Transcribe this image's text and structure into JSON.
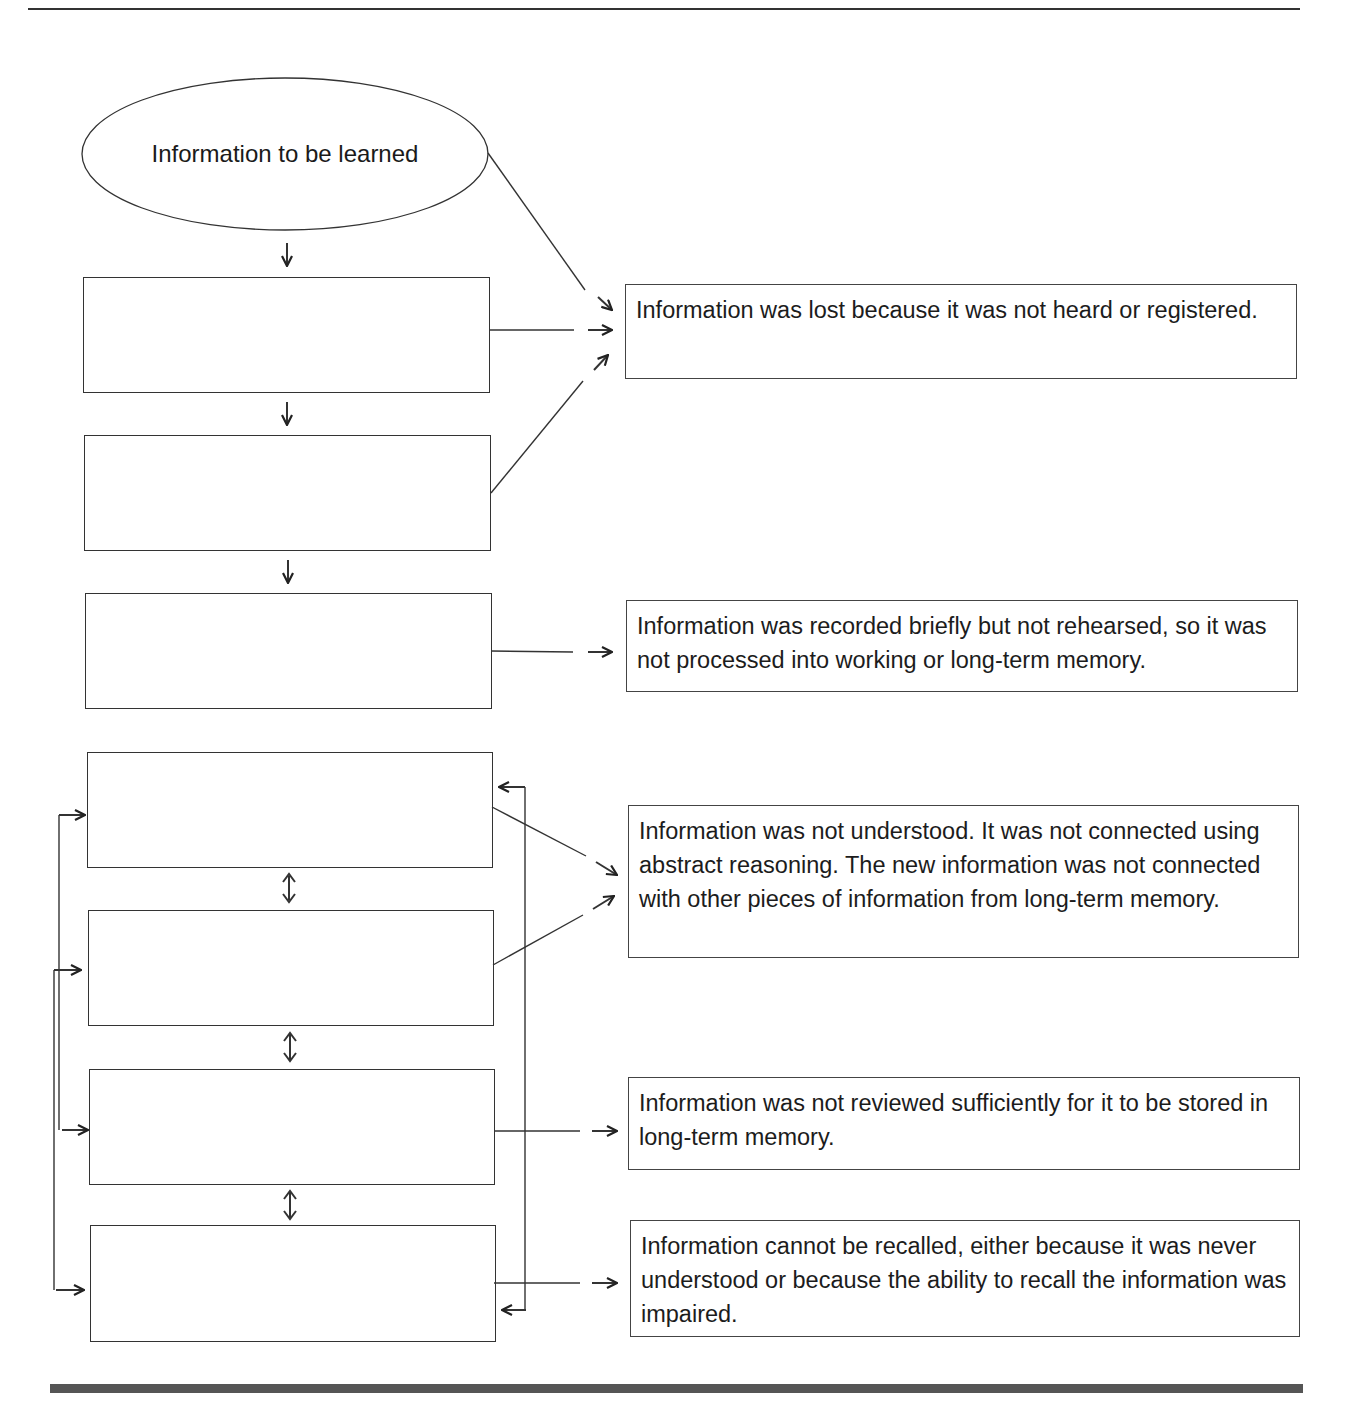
{
  "figure": {
    "header_caption": "Figure",
    "start_node": {
      "label": "Information to be learned",
      "shape": "ellipse"
    },
    "stages": [
      {
        "id": 1,
        "label": ""
      },
      {
        "id": 2,
        "label": ""
      },
      {
        "id": 3,
        "label": ""
      },
      {
        "id": 4,
        "label": ""
      },
      {
        "id": 5,
        "label": ""
      },
      {
        "id": 6,
        "label": ""
      },
      {
        "id": 7,
        "label": ""
      },
      {
        "id": 8,
        "label": ""
      }
    ],
    "outcomes": [
      {
        "id": "a",
        "text": "Information was lost because it was not heard or registered.",
        "sources": [
          "start",
          1,
          2
        ]
      },
      {
        "id": "b",
        "text": "Information was recorded briefly but not rehearsed, so it was not processed into working or long-term memory.",
        "sources": [
          3
        ]
      },
      {
        "id": "c",
        "text": "Information was not understood. It was not connected using abstract reasoning. The new information was not connected with other pieces of information from long-term memory.",
        "sources": [
          4,
          5
        ]
      },
      {
        "id": "d",
        "text": "Information was not reviewed sufficiently for it to be stored in long-term memory.",
        "sources": [
          6
        ]
      },
      {
        "id": "e",
        "text": "Information cannot be recalled, either because it was never understood or because the ability to recall the information was impaired.",
        "sources": [
          7
        ]
      }
    ],
    "connections": {
      "sequential_down": [
        "start→1",
        "1→2",
        "2→3"
      ],
      "bidirectional": [
        "4↔5",
        "5↔6",
        "6↔7"
      ],
      "left_feedback": [
        "4→6 (loop)",
        "5→7 (loop)"
      ],
      "right_feedback": [
        "4↔7 (loop)"
      ]
    },
    "colors": {
      "line": "#333333",
      "text": "#1a1a1a",
      "footer_bar": "#555555"
    }
  }
}
